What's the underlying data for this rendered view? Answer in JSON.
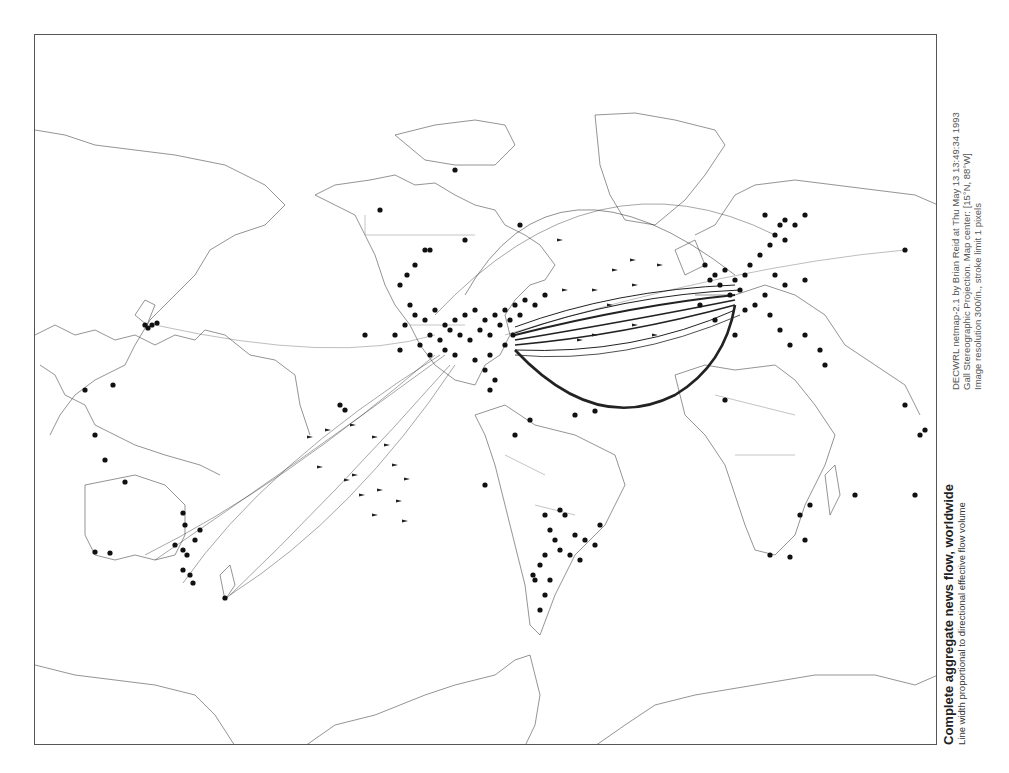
{
  "title": {
    "main": "Complete aggregate news flow, worldwide",
    "subtitle": "Line width proportional to directional effective flow volume"
  },
  "meta": {
    "line1": "DECWRL netmap-2.1 by Brian Reid at Thu May 13 13:49:34 1993",
    "line2": "Gall Stereographic Projection.  Map center: [15°N, 88°W]",
    "line3": "Image resolution 300/in., stroke limit 1 pixels"
  },
  "map": {
    "projection": "Gall Stereographic",
    "center": "15°N, 88°W",
    "colors": {
      "coast": "#666666",
      "flow": "#222222",
      "city": "#111111",
      "frame": "#555555"
    },
    "coastlines": [
      "M0,300 L20,290 L40,300 L60,295 L80,305 L100,300 L120,310 L140,300 L160,305 L170,295 L190,300 L215,320 L240,325 L260,340 L265,370 L275,400",
      "M0,95 L30,100 L60,110 L100,115 L140,120 L190,130 L230,150 L250,170 L230,190 L200,200 L175,215 L160,240 L140,260 L115,285 L100,310 L90,330 L60,345 L40,360 L25,380 L15,400",
      "M100,280 L110,265 L120,270 L112,290 Z",
      "M5,330 L20,340 L30,360 L50,370 L60,390 L80,400 L100,410 L130,420 L165,430 L185,440",
      "M50,450 L100,440 L130,450 L150,470 L150,500 L140,520 L120,525 L100,520 L80,525 L60,520 L50,500 Z",
      "M185,540 L195,530 L200,550 L190,565 Z",
      "M335,145 L360,140 L380,150 L400,148 L420,160 L440,170 L460,175 L470,190 L490,200 L505,210 L520,230 L510,245 L495,250 L480,265 L470,280 L475,300 L465,320 L450,330 L440,350 L420,345 L400,330 L385,310 L375,290 L360,270 L350,250 L340,220 L330,200 L320,180 L300,170 L280,160 L300,150 Z",
      "M360,100 L400,90 L440,85 L470,90 L480,110 L460,130 L420,130 L390,125 Z",
      "M560,80 L600,78 L640,85 L680,95 L690,110 L670,140 L650,165 L620,190 L590,185 L575,160 L565,130 Z",
      "M440,380 L470,370 L500,390 L540,400 L580,420 L590,450 L570,490 L540,520 L520,560 L505,600 L495,590 L490,550 L480,510 L470,470 L460,430 L450,400 Z",
      "M640,340 L670,330 L700,335 L740,330 L760,345 L780,370 L800,400 L790,430 L770,470 L760,500 L740,520 L720,515 L710,490 L700,460 L690,430 L670,400 L650,380 Z",
      "M790,440 L800,430 L805,460 L795,480 Z",
      "M660,200 L680,190 L700,160 L720,150 L760,145 L800,150 L840,155 L880,160 L903,170",
      "M660,260 L700,260 L730,250 L760,260 L790,280 L810,310 L840,330 L870,350 L885,380",
      "M640,215 L660,205 L670,230 L650,240 Z",
      "M0,630 L40,640 L80,645 L120,650 L160,660 L180,680 L200,711",
      "M270,711 L300,690 L340,680 L390,660 L420,650 L460,640 L480,625 L495,620 L500,640 L505,660 L500,690 L490,711",
      "M560,711 L590,690 L620,670 L660,660 L720,650 L780,640 L840,640 L880,650 L903,640"
    ],
    "borders": [
      "M330,200 L440,200",
      "M330,180 L330,200",
      "M375,290 L430,290",
      "M470,420 L510,440",
      "M500,470 L540,480",
      "M680,360 L760,380",
      "M700,420 L760,420"
    ],
    "cities": [
      [
        380,
        280
      ],
      [
        390,
        285
      ],
      [
        400,
        275
      ],
      [
        410,
        290
      ],
      [
        420,
        285
      ],
      [
        430,
        280
      ],
      [
        440,
        275
      ],
      [
        450,
        285
      ],
      [
        460,
        280
      ],
      [
        470,
        275
      ],
      [
        480,
        270
      ],
      [
        490,
        265
      ],
      [
        500,
        270
      ],
      [
        510,
        260
      ],
      [
        395,
        300
      ],
      [
        405,
        305
      ],
      [
        415,
        295
      ],
      [
        425,
        300
      ],
      [
        435,
        305
      ],
      [
        445,
        295
      ],
      [
        455,
        300
      ],
      [
        465,
        290
      ],
      [
        475,
        285
      ],
      [
        485,
        280
      ],
      [
        385,
        310
      ],
      [
        395,
        320
      ],
      [
        410,
        315
      ],
      [
        420,
        320
      ],
      [
        440,
        325
      ],
      [
        455,
        320
      ],
      [
        470,
        310
      ],
      [
        478,
        300
      ],
      [
        370,
        290
      ],
      [
        375,
        270
      ],
      [
        365,
        250
      ],
      [
        372,
        240
      ],
      [
        380,
        230
      ],
      [
        390,
        215
      ],
      [
        360,
        300
      ],
      [
        365,
        315
      ],
      [
        450,
        335
      ],
      [
        460,
        345
      ],
      [
        455,
        355
      ],
      [
        430,
        205
      ],
      [
        395,
        215
      ],
      [
        670,
        230
      ],
      [
        680,
        240
      ],
      [
        690,
        235
      ],
      [
        700,
        245
      ],
      [
        710,
        240
      ],
      [
        705,
        255
      ],
      [
        695,
        260
      ],
      [
        685,
        250
      ],
      [
        675,
        245
      ],
      [
        715,
        230
      ],
      [
        725,
        220
      ],
      [
        735,
        210
      ],
      [
        740,
        200
      ],
      [
        745,
        190
      ],
      [
        750,
        185
      ],
      [
        730,
        260
      ],
      [
        720,
        270
      ],
      [
        710,
        275
      ],
      [
        740,
        240
      ],
      [
        750,
        250
      ],
      [
        735,
        280
      ],
      [
        745,
        295
      ],
      [
        755,
        310
      ],
      [
        770,
        300
      ],
      [
        785,
        315
      ],
      [
        790,
        330
      ],
      [
        665,
        270
      ],
      [
        680,
        285
      ],
      [
        700,
        300
      ],
      [
        750,
        205
      ],
      [
        760,
        190
      ],
      [
        770,
        180
      ],
      [
        730,
        180
      ],
      [
        770,
        245
      ],
      [
        870,
        215
      ],
      [
        110,
        290
      ],
      [
        113,
        293
      ],
      [
        117,
        290
      ],
      [
        122,
        288
      ],
      [
        78,
        350
      ],
      [
        50,
        355
      ],
      [
        60,
        400
      ],
      [
        70,
        425
      ],
      [
        90,
        447
      ],
      [
        140,
        510
      ],
      [
        148,
        515
      ],
      [
        152,
        520
      ],
      [
        148,
        535
      ],
      [
        155,
        540
      ],
      [
        158,
        548
      ],
      [
        160,
        505
      ],
      [
        165,
        495
      ],
      [
        150,
        490
      ],
      [
        148,
        478
      ],
      [
        190,
        563
      ],
      [
        60,
        517
      ],
      [
        75,
        518
      ],
      [
        510,
        480
      ],
      [
        515,
        495
      ],
      [
        520,
        505
      ],
      [
        525,
        515
      ],
      [
        510,
        520
      ],
      [
        505,
        530
      ],
      [
        500,
        545
      ],
      [
        515,
        545
      ],
      [
        535,
        520
      ],
      [
        545,
        525
      ],
      [
        550,
        505
      ],
      [
        560,
        510
      ],
      [
        540,
        500
      ],
      [
        525,
        475
      ],
      [
        530,
        480
      ],
      [
        565,
        490
      ],
      [
        510,
        560
      ],
      [
        505,
        575
      ],
      [
        498,
        540
      ],
      [
        735,
        520
      ],
      [
        755,
        522
      ],
      [
        770,
        505
      ],
      [
        765,
        480
      ],
      [
        775,
        470
      ],
      [
        880,
        460
      ],
      [
        885,
        400
      ],
      [
        870,
        370
      ],
      [
        890,
        395
      ],
      [
        820,
        460
      ],
      [
        690,
        365
      ],
      [
        305,
        370
      ],
      [
        310,
        375
      ],
      [
        450,
        450
      ],
      [
        480,
        400
      ],
      [
        495,
        385
      ],
      [
        540,
        380
      ],
      [
        560,
        376
      ],
      [
        330,
        300
      ],
      [
        420,
        135
      ],
      [
        485,
        190
      ],
      [
        345,
        175
      ]
    ],
    "arrows": [
      [
        275,
        402
      ],
      [
        285,
        432
      ],
      [
        293,
        395
      ],
      [
        318,
        390
      ],
      [
        312,
        445
      ],
      [
        340,
        402
      ],
      [
        352,
        410
      ],
      [
        345,
        455
      ],
      [
        360,
        430
      ],
      [
        364,
        466
      ],
      [
        370,
        486
      ],
      [
        340,
        480
      ],
      [
        327,
        460
      ],
      [
        372,
        444
      ],
      [
        320,
        440
      ],
      [
        525,
        205
      ],
      [
        530,
        255
      ],
      [
        560,
        255
      ],
      [
        575,
        270
      ],
      [
        600,
        290
      ],
      [
        620,
        300
      ],
      [
        600,
        250
      ],
      [
        580,
        235
      ],
      [
        560,
        300
      ],
      [
        545,
        305
      ],
      [
        598,
        225
      ],
      [
        625,
        230
      ]
    ],
    "flows": [
      {
        "d": "M480,300 Q600,270 700,260",
        "w": 2.2
      },
      {
        "d": "M480,305 Q600,285 700,265",
        "w": 1.6
      },
      {
        "d": "M480,310 Q590,300 700,270",
        "w": 1.4
      },
      {
        "d": "M480,298 Q590,260 705,255",
        "w": 1.2
      },
      {
        "d": "M480,315 Q600,320 700,275",
        "w": 1.0
      },
      {
        "d": "M480,292 Q580,255 700,250",
        "w": 1.0
      },
      {
        "d": "M480,320 Q590,330 705,280",
        "w": 0.8
      },
      {
        "d": "M480,315 Q560,400 640,360 Q690,330 700,270",
        "w": 2.6
      },
      {
        "d": "M400,320 Q250,450 110,520",
        "w": 0.4
      },
      {
        "d": "M410,320 Q260,430 120,525",
        "w": 0.4
      },
      {
        "d": "M415,330 Q300,460 190,565",
        "w": 0.4
      },
      {
        "d": "M420,330 Q320,480 195,560",
        "w": 0.4
      },
      {
        "d": "M405,320 Q230,430 148,548",
        "w": 0.4
      },
      {
        "d": "M430,260 Q520,100 700,240",
        "w": 0.5
      },
      {
        "d": "M400,280 Q560,110 740,200",
        "w": 0.4
      },
      {
        "d": "M470,300 Q700,230 870,215",
        "w": 0.3
      },
      {
        "d": "M400,300 Q300,330 120,290",
        "w": 0.3
      }
    ]
  }
}
